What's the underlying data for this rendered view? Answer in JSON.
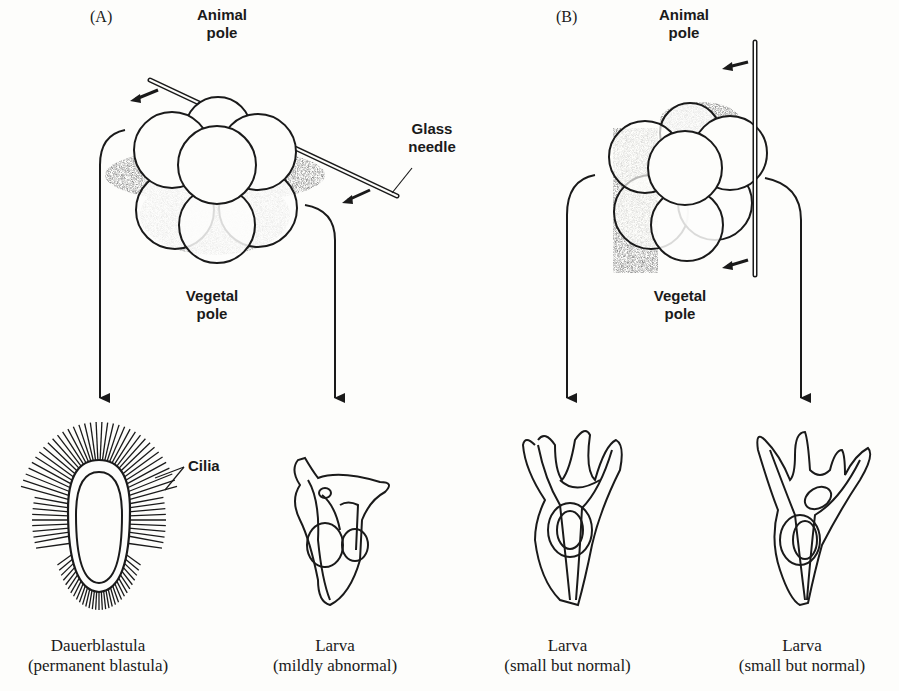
{
  "panels": [
    {
      "id": "A",
      "label": "(A)",
      "animal_pole": "Animal pole",
      "animal_pole_lines": [
        "Animal",
        "pole"
      ],
      "vegetal_pole_lines": [
        "Vegetal",
        "pole"
      ],
      "needle_label_lines": [
        "Glass",
        "needle"
      ],
      "outcomes": [
        {
          "title": "Dauerblastula",
          "subtitle": "(permanent blastula)",
          "annotation": "Cilia"
        },
        {
          "title": "Larva",
          "subtitle": "(mildly abnormal)"
        }
      ]
    },
    {
      "id": "B",
      "label": "(B)",
      "animal_pole_lines": [
        "Animal",
        "pole"
      ],
      "vegetal_pole_lines": [
        "Vegetal",
        "pole"
      ],
      "outcomes": [
        {
          "title": "Larva",
          "subtitle": "(small but normal)"
        },
        {
          "title": "Larva",
          "subtitle": "(small but normal)"
        }
      ]
    }
  ],
  "colors": {
    "ink": "#1a1a1a",
    "background": "#fdfdfb",
    "stipple": "#555555"
  }
}
